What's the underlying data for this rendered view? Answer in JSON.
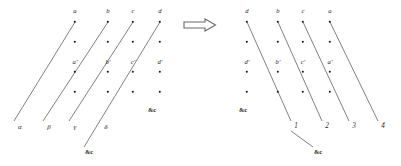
{
  "figure": {
    "background": "#ffffff",
    "ink": "#1a1a1a",
    "line_color": "#555555",
    "transform_arrow": {
      "glyph": "double-line-right-arrow",
      "x": 200,
      "y": 27
    },
    "left_diagram": {
      "name": "source-lattice",
      "top_labels": [
        {
          "text": "a",
          "x": 75,
          "y": 11
        },
        {
          "text": "b",
          "x": 108,
          "y": 11
        },
        {
          "text": "c",
          "x": 133,
          "y": 11
        },
        {
          "text": "d",
          "x": 160,
          "y": 11
        }
      ],
      "mid_labels": [
        {
          "text": "a′",
          "x": 75,
          "y": 62
        },
        {
          "text": "b′",
          "x": 108,
          "y": 62
        },
        {
          "text": "c′",
          "x": 133,
          "y": 62
        },
        {
          "text": "d′",
          "x": 160,
          "y": 62
        }
      ],
      "bottom_labels": [
        {
          "text": "α",
          "x": 20,
          "y": 127
        },
        {
          "text": "β",
          "x": 49,
          "y": 127
        },
        {
          "text": "γ",
          "x": 75,
          "y": 127
        },
        {
          "text": "δ",
          "x": 106,
          "y": 127
        }
      ],
      "etc_labels": [
        {
          "text": "&c",
          "x": 152,
          "y": 110
        },
        {
          "text": "&c",
          "x": 89,
          "y": 152
        }
      ],
      "columns_x": [
        75,
        108,
        133,
        160
      ],
      "dot_rows_y": [
        22,
        42,
        72,
        92
      ],
      "edges": [
        {
          "x1": 14,
          "y1": 121,
          "x2": 75,
          "y2": 22
        },
        {
          "x1": 43,
          "y1": 121,
          "x2": 108,
          "y2": 22
        },
        {
          "x1": 69,
          "y1": 121,
          "x2": 133,
          "y2": 22
        },
        {
          "x1": 84,
          "y1": 147,
          "x2": 160,
          "y2": 22
        }
      ]
    },
    "right_diagram": {
      "name": "target-lattice",
      "top_labels": [
        {
          "text": "d",
          "x": 247,
          "y": 11
        },
        {
          "text": "b",
          "x": 278,
          "y": 11
        },
        {
          "text": "c",
          "x": 303,
          "y": 11
        },
        {
          "text": "a",
          "x": 330,
          "y": 11
        }
      ],
      "mid_labels": [
        {
          "text": "d′",
          "x": 247,
          "y": 62
        },
        {
          "text": "b′",
          "x": 278,
          "y": 62
        },
        {
          "text": "c′",
          "x": 303,
          "y": 62
        },
        {
          "text": "a′",
          "x": 330,
          "y": 62
        }
      ],
      "bottom_labels": [
        {
          "text": "1",
          "x": 296,
          "y": 127
        },
        {
          "text": "2",
          "x": 327,
          "y": 127
        },
        {
          "text": "3",
          "x": 354,
          "y": 127
        },
        {
          "text": "4",
          "x": 383,
          "y": 127
        }
      ],
      "etc_labels": [
        {
          "text": "&c",
          "x": 243,
          "y": 110
        },
        {
          "text": "&c",
          "x": 318,
          "y": 152
        }
      ],
      "columns_x": [
        247,
        278,
        303,
        330
      ],
      "dot_rows_y": [
        22,
        42,
        72,
        92
      ],
      "edges": [
        {
          "x1": 247,
          "y1": 22,
          "x2": 291,
          "y2": 121
        },
        {
          "x1": 278,
          "y1": 22,
          "x2": 322,
          "y2": 121
        },
        {
          "x1": 303,
          "y1": 22,
          "x2": 349,
          "y2": 121
        },
        {
          "x1": 330,
          "y1": 22,
          "x2": 378,
          "y2": 121
        },
        {
          "x1": 291,
          "y1": 131,
          "x2": 313,
          "y2": 147
        }
      ]
    }
  }
}
